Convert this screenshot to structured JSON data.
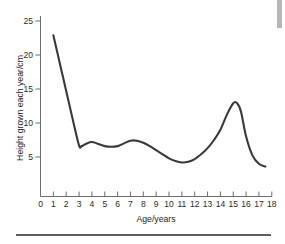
{
  "chart_data": {
    "type": "line",
    "title": "",
    "xlabel": "Age/years",
    "ylabel": "Height grown each year/cm",
    "xlim": [
      0,
      18
    ],
    "ylim": [
      0,
      25
    ],
    "grid": false,
    "legend": null,
    "xticks": [
      "0",
      "1",
      "2",
      "3",
      "4",
      "5",
      "6",
      "7",
      "8",
      "9",
      "10",
      "11",
      "12",
      "13",
      "14",
      "15",
      "16",
      "17",
      "18"
    ],
    "yticks": [
      "5",
      "10",
      "15",
      "20",
      "25"
    ],
    "series": [
      {
        "name": "Height grown each year",
        "color": "#3a3a3a",
        "x": [
          1.0,
          1.5,
          2.0,
          2.5,
          3.0,
          3.2,
          3.6,
          4.0,
          4.4,
          5.0,
          5.5,
          6.0,
          6.5,
          7.0,
          7.5,
          8.0,
          8.5,
          9.0,
          9.5,
          10.0,
          10.5,
          11.0,
          11.5,
          12.0,
          12.5,
          13.0,
          13.5,
          14.0,
          14.5,
          15.0,
          15.3,
          15.6,
          16.0,
          16.5,
          17.0,
          17.5
        ],
        "y": [
          22.9,
          18.8,
          14.7,
          10.6,
          6.7,
          6.6,
          7.0,
          7.2,
          7.0,
          6.6,
          6.5,
          6.6,
          7.0,
          7.4,
          7.4,
          7.1,
          6.6,
          6.0,
          5.4,
          4.8,
          4.4,
          4.2,
          4.3,
          4.7,
          5.4,
          6.3,
          7.5,
          9.0,
          11.2,
          12.9,
          12.9,
          11.7,
          8.0,
          5.2,
          4.0,
          3.6
        ]
      }
    ]
  },
  "decorations": {
    "scrollbar_name": "scrollbar-fragment",
    "rule_name": "bottom-divider"
  }
}
